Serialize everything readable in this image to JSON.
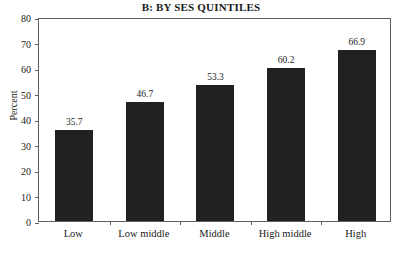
{
  "chart_data": {
    "type": "bar",
    "title": "B: BY SES QUINTILES",
    "xlabel": "",
    "ylabel": "Percent",
    "categories": [
      "Low",
      "Low middle",
      "Middle",
      "High middle",
      "High"
    ],
    "values": [
      35.7,
      46.7,
      53.3,
      60.2,
      66.9
    ],
    "value_labels": [
      "35.7",
      "46.7",
      "53.3",
      "60.2",
      "66.9"
    ],
    "ylim": [
      0,
      80
    ],
    "ytick_step": 10,
    "ytick_labels": [
      "0",
      "10",
      "20",
      "30",
      "40",
      "50",
      "60",
      "70",
      "80"
    ],
    "grid": false,
    "legend": "none",
    "bar_color": "#212121",
    "frame_color": "#5e5e5e",
    "background_color": "#ffffff"
  }
}
